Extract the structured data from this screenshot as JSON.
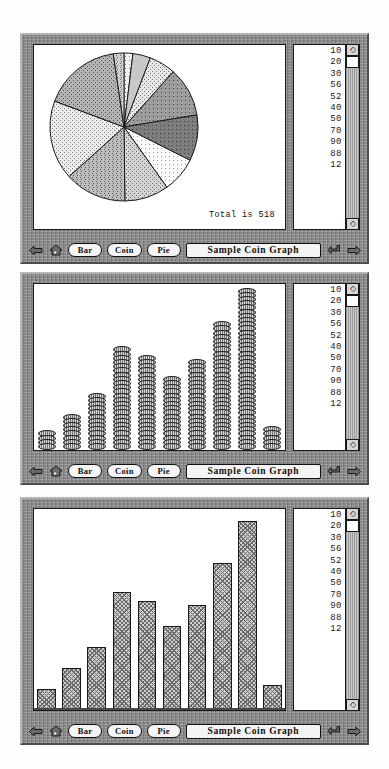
{
  "app": {
    "title": "Sample Coin Graph"
  },
  "toolbar": {
    "back_icon": "left-arrow-icon",
    "home_icon": "home-icon",
    "buttons": [
      {
        "label": "Bar",
        "name": "bar-button"
      },
      {
        "label": "Coin",
        "name": "coin-button"
      },
      {
        "label": "Pie",
        "name": "pie-button"
      }
    ],
    "title_value": "Sample Coin Graph",
    "enter_icon": "return-icon",
    "forward_icon": "right-arrow-icon"
  },
  "data_list": {
    "values": [
      10,
      20,
      30,
      56,
      52,
      40,
      50,
      70,
      90,
      88,
      12
    ],
    "scroll_up_glyph": "◇",
    "scroll_down_glyph": "◇"
  },
  "panels": [
    {
      "name": "pie-panel",
      "view": "Pie",
      "total_label": "Total is 518"
    },
    {
      "name": "coin-panel",
      "view": "Coin"
    },
    {
      "name": "bar-panel",
      "view": "Bar"
    }
  ],
  "chart_data": [
    {
      "type": "pie",
      "title": "Sample Coin Graph",
      "categories": [
        "10",
        "20",
        "30",
        "56",
        "52",
        "40",
        "50",
        "70",
        "90",
        "88",
        "12"
      ],
      "values": [
        10,
        20,
        30,
        56,
        52,
        40,
        50,
        70,
        90,
        88,
        12
      ],
      "total": 518,
      "total_label": "Total is 518",
      "start_angle_deg": 0,
      "direction": "clockwise",
      "legend": "right-list",
      "annotations": [
        "Total is 518"
      ]
    },
    {
      "type": "bar",
      "style": "coin-stacks",
      "title": "Sample Coin Graph",
      "categories": [
        "10",
        "20",
        "30",
        "56",
        "52",
        "40",
        "50",
        "70",
        "90",
        "12"
      ],
      "values": [
        10,
        20,
        30,
        56,
        52,
        40,
        50,
        70,
        90,
        12
      ],
      "xlabel": "",
      "ylabel": "",
      "ylim": [
        0,
        90
      ],
      "grid": false
    },
    {
      "type": "bar",
      "title": "Sample Coin Graph",
      "categories": [
        "10",
        "20",
        "30",
        "56",
        "52",
        "40",
        "50",
        "70",
        "90",
        "12"
      ],
      "values": [
        10,
        20,
        30,
        56,
        52,
        40,
        50,
        70,
        90,
        12
      ],
      "xlabel": "",
      "ylabel": "",
      "ylim": [
        0,
        90
      ],
      "grid": false
    }
  ],
  "colors": {
    "frame": "#8a8a8a",
    "canvas": "#ffffff",
    "ink": "#1a1a1a",
    "button_face": "#f4f4f4"
  }
}
